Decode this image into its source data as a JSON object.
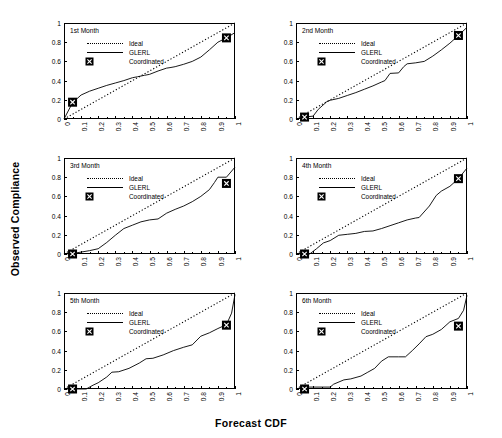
{
  "figure": {
    "ylabel": "Observed Compliance",
    "xlabel": "Forecast CDF"
  },
  "legend": {
    "ideal": "Ideal",
    "glerl": "GLERL",
    "coordinated": "Coordinated"
  },
  "axes": {
    "yticks": [
      "0",
      "0.2",
      "0.4",
      "0.6",
      "0.8",
      "1"
    ],
    "xticks": [
      "0",
      "0.1",
      "0.2",
      "0.3",
      "0.4",
      "0.5",
      "0.6",
      "0.7",
      "0.8",
      "0.9",
      "1"
    ]
  },
  "panels": [
    {
      "title": "1st Month"
    },
    {
      "title": "2nd Month"
    },
    {
      "title": "3rd Month"
    },
    {
      "title": "4th Month"
    },
    {
      "title": "5th Month"
    },
    {
      "title": "6th Month"
    }
  ],
  "chart_data": {
    "type": "line",
    "title": "",
    "xlabel": "Forecast CDF",
    "ylabel": "Observed Compliance",
    "xlim": [
      0,
      1
    ],
    "ylim": [
      0,
      1
    ],
    "grid": false,
    "legend_position": "upper-left-inside",
    "colors": {
      "ideal": "#000000",
      "glerl": "#000000",
      "coordinated": "#000000"
    },
    "ytick_values": [
      0,
      0.2,
      0.4,
      0.6,
      0.8,
      1
    ],
    "xtick_values": [
      0,
      0.1,
      0.2,
      0.3,
      0.4,
      0.5,
      0.6,
      0.7,
      0.8,
      0.9,
      1
    ],
    "panels": [
      {
        "title": "1st Month",
        "series": [
          {
            "name": "Ideal",
            "style": "dotted",
            "x": [
              0,
              1
            ],
            "y": [
              0,
              1
            ]
          },
          {
            "name": "GLERL",
            "style": "solid",
            "x": [
              0,
              0.05,
              0.1,
              0.15,
              0.2,
              0.25,
              0.3,
              0.35,
              0.4,
              0.43,
              0.47,
              0.5,
              0.55,
              0.6,
              0.62,
              0.65,
              0.7,
              0.75,
              0.8,
              0.85,
              0.9,
              0.95,
              1
            ],
            "y": [
              0,
              0.17,
              0.25,
              0.29,
              0.32,
              0.35,
              0.375,
              0.4,
              0.43,
              0.44,
              0.455,
              0.465,
              0.5,
              0.53,
              0.535,
              0.545,
              0.57,
              0.6,
              0.645,
              0.72,
              0.8,
              0.845,
              0.9
            ]
          },
          {
            "name": "Coordinated",
            "style": "marker",
            "x": [
              0.05,
              0.95
            ],
            "y": [
              0.175,
              0.845
            ]
          }
        ]
      },
      {
        "title": "2nd Month",
        "series": [
          {
            "name": "Ideal",
            "style": "dotted",
            "x": [
              0,
              1
            ],
            "y": [
              0,
              1
            ]
          },
          {
            "name": "GLERL",
            "style": "solid",
            "x": [
              0,
              0.05,
              0.1,
              0.13,
              0.18,
              0.2,
              0.25,
              0.3,
              0.35,
              0.4,
              0.45,
              0.5,
              0.52,
              0.55,
              0.6,
              0.63,
              0.65,
              0.7,
              0.75,
              0.8,
              0.85,
              0.9,
              0.95,
              1
            ],
            "y": [
              0,
              0.02,
              0.03,
              0.1,
              0.18,
              0.195,
              0.215,
              0.245,
              0.275,
              0.31,
              0.345,
              0.385,
              0.4,
              0.475,
              0.48,
              0.545,
              0.575,
              0.585,
              0.6,
              0.655,
              0.72,
              0.79,
              0.87,
              0.955
            ]
          },
          {
            "name": "Coordinated",
            "style": "marker",
            "x": [
              0.05,
              0.95
            ],
            "y": [
              0.02,
              0.87
            ]
          }
        ]
      },
      {
        "title": "3rd Month",
        "series": [
          {
            "name": "Ideal",
            "style": "dotted",
            "x": [
              0,
              1
            ],
            "y": [
              0,
              1
            ]
          },
          {
            "name": "GLERL",
            "style": "solid",
            "x": [
              0,
              0.05,
              0.1,
              0.15,
              0.2,
              0.25,
              0.3,
              0.35,
              0.4,
              0.45,
              0.5,
              0.55,
              0.6,
              0.65,
              0.7,
              0.75,
              0.8,
              0.85,
              0.88,
              0.9,
              0.95,
              1
            ],
            "y": [
              0,
              0.005,
              0.02,
              0.035,
              0.055,
              0.12,
              0.195,
              0.265,
              0.3,
              0.335,
              0.355,
              0.365,
              0.425,
              0.465,
              0.5,
              0.545,
              0.6,
              0.67,
              0.745,
              0.8,
              0.8,
              0.905
            ]
          },
          {
            "name": "Coordinated",
            "style": "marker",
            "x": [
              0.05,
              0.95
            ],
            "y": [
              0.0,
              0.735
            ]
          }
        ]
      },
      {
        "title": "4th Month",
        "series": [
          {
            "name": "Ideal",
            "style": "dotted",
            "x": [
              0,
              1
            ],
            "y": [
              0,
              1
            ]
          },
          {
            "name": "GLERL",
            "style": "solid",
            "x": [
              0,
              0.08,
              0.12,
              0.16,
              0.2,
              0.25,
              0.3,
              0.35,
              0.4,
              0.45,
              0.5,
              0.55,
              0.6,
              0.65,
              0.7,
              0.72,
              0.78,
              0.82,
              0.85,
              0.9,
              0.95,
              1
            ],
            "y": [
              0,
              0.0,
              0.055,
              0.115,
              0.14,
              0.195,
              0.205,
              0.215,
              0.235,
              0.24,
              0.265,
              0.295,
              0.325,
              0.355,
              0.375,
              0.38,
              0.5,
              0.61,
              0.655,
              0.705,
              0.785,
              0.895
            ]
          },
          {
            "name": "Coordinated",
            "style": "marker",
            "x": [
              0.05,
              0.95
            ],
            "y": [
              0.0,
              0.785
            ]
          }
        ]
      },
      {
        "title": "5th Month",
        "series": [
          {
            "name": "Ideal",
            "style": "dotted",
            "x": [
              0,
              1
            ],
            "y": [
              0,
              1
            ]
          },
          {
            "name": "GLERL",
            "style": "solid",
            "x": [
              0,
              0.13,
              0.17,
              0.2,
              0.25,
              0.28,
              0.32,
              0.38,
              0.44,
              0.48,
              0.52,
              0.58,
              0.64,
              0.7,
              0.75,
              0.8,
              0.85,
              0.9,
              0.95,
              0.98,
              1
            ],
            "y": [
              0,
              0.0,
              0.04,
              0.065,
              0.125,
              0.175,
              0.18,
              0.215,
              0.27,
              0.315,
              0.32,
              0.355,
              0.4,
              0.435,
              0.46,
              0.55,
              0.585,
              0.63,
              0.67,
              0.79,
              0.985
            ]
          },
          {
            "name": "Coordinated",
            "style": "marker",
            "x": [
              0.05,
              0.95
            ],
            "y": [
              0.0,
              0.665
            ]
          }
        ]
      },
      {
        "title": "6th Month",
        "series": [
          {
            "name": "Ideal",
            "style": "dotted",
            "x": [
              0,
              1
            ],
            "y": [
              0,
              1
            ]
          },
          {
            "name": "GLERL",
            "style": "solid",
            "x": [
              0,
              0.05,
              0.2,
              0.22,
              0.28,
              0.32,
              0.38,
              0.42,
              0.46,
              0.5,
              0.54,
              0.6,
              0.64,
              0.68,
              0.72,
              0.76,
              0.8,
              0.85,
              0.9,
              0.95,
              0.98,
              1
            ],
            "y": [
              0,
              0.02,
              0.02,
              0.05,
              0.095,
              0.105,
              0.135,
              0.175,
              0.215,
              0.29,
              0.335,
              0.335,
              0.335,
              0.4,
              0.47,
              0.545,
              0.57,
              0.62,
              0.7,
              0.735,
              0.82,
              0.975
            ]
          },
          {
            "name": "Coordinated",
            "style": "marker",
            "x": [
              0.05,
              0.95
            ],
            "y": [
              0.0,
              0.655
            ]
          }
        ]
      }
    ]
  }
}
